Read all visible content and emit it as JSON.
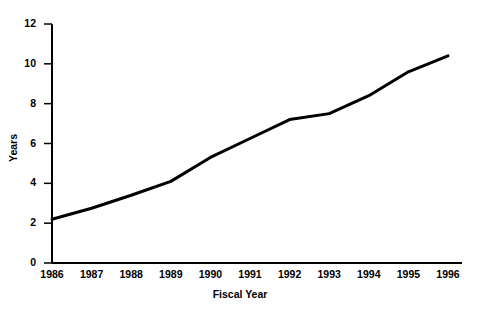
{
  "chart_data": {
    "type": "line",
    "title": "",
    "xlabel": "Fiscal Year",
    "ylabel": "Years",
    "categories": [
      "1986",
      "1987",
      "1988",
      "1989",
      "1990",
      "1991",
      "1992",
      "1993",
      "1994",
      "1995",
      "1996"
    ],
    "x": [
      1986,
      1987,
      1988,
      1989,
      1990,
      1991,
      1992,
      1993,
      1994,
      1995,
      1996
    ],
    "values": [
      2.2,
      2.75,
      3.4,
      4.1,
      5.3,
      6.25,
      7.2,
      7.5,
      8.4,
      9.6,
      10.4
    ],
    "series": [
      {
        "name": "Years",
        "values": [
          2.2,
          2.75,
          3.4,
          4.1,
          5.3,
          6.25,
          7.2,
          7.5,
          8.4,
          9.6,
          10.4
        ]
      }
    ],
    "xlim": [
      1986,
      1996
    ],
    "ylim": [
      0,
      12
    ],
    "yticks": [
      0,
      2,
      4,
      6,
      8,
      10,
      12
    ],
    "ytick_labels": [
      "0",
      "2",
      "4",
      "6",
      "8",
      "10",
      "12"
    ],
    "xtick_labels": [
      "1986",
      "1987",
      "1988",
      "1989",
      "1990",
      "1991",
      "1992",
      "1993",
      "1994",
      "1995",
      "1996"
    ],
    "grid": false,
    "legend": false,
    "legend_position": "none",
    "line_color": "#000000",
    "line_width": 3,
    "background_color": "#ffffff",
    "axis_color": "#000000"
  }
}
